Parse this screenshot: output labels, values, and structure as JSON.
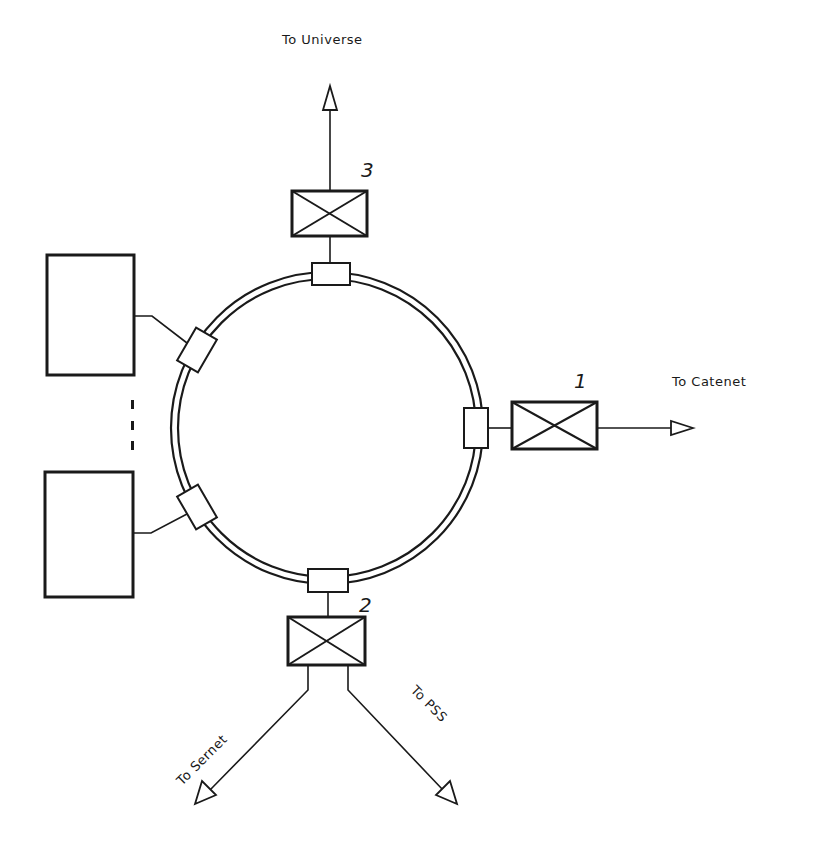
{
  "diagram": {
    "type": "network-ring-topology",
    "ring": {
      "label": ""
    },
    "gateways": [
      {
        "id": "1",
        "number_label": "1",
        "destination_label": "To Catenet"
      },
      {
        "id": "2",
        "number_label": "2",
        "destination_labels": [
          "To Sernet",
          "To PSS"
        ]
      },
      {
        "id": "3",
        "number_label": "3",
        "destination_label": "To Universe"
      }
    ],
    "hosts": [
      {
        "id": "host-top",
        "label": ""
      },
      {
        "id": "host-bottom",
        "label": ""
      }
    ],
    "ellipsis": "..."
  },
  "labels": {
    "to_universe": "To Universe",
    "to_catenet": "To Catenet",
    "to_sernet": "To Sernet",
    "to_pss": "To PSS",
    "gw1": "1",
    "gw2": "2",
    "gw3": "3"
  },
  "colors": {
    "ink": "#1a1a1a",
    "background": "#ffffff"
  }
}
